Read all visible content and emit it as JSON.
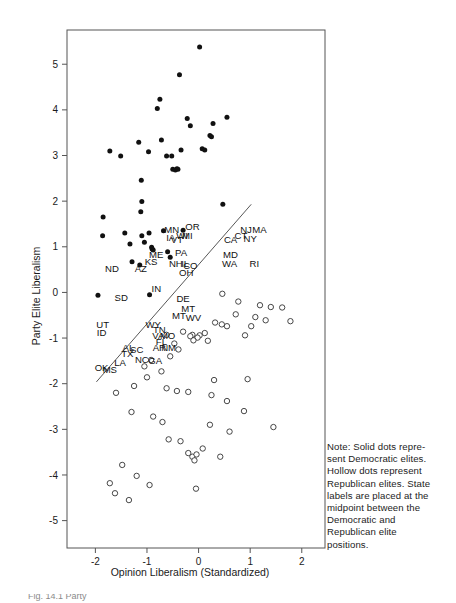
{
  "figure": {
    "note": {
      "lines": [
        "Note: Solid dots repre-",
        "sent Democratic  elites.",
        "Hollow dots represent",
        "Republican elites. State",
        "labels are placed at the",
        "midpoint between the",
        "Democratic and",
        "Republican elite",
        "positions."
      ]
    },
    "caption_fragment": "Fig. 14.1 Party",
    "colors": {
      "democratic_dot": "#111111",
      "republican_dot": "#ffffff",
      "republican_dot_stroke": "#333333",
      "frame": "#555555",
      "fit_line": "#444444",
      "text": "#1a1a1a"
    }
  },
  "chart_data": {
    "type": "scatter",
    "title": "",
    "xlabel": "Opinion Liberalism (Standardized)",
    "ylabel": "Party Elite Liberalism",
    "xlim": [
      -2.55,
      2.45
    ],
    "ylim": [
      -5.6,
      5.75
    ],
    "xticks": [
      -2,
      -1,
      0,
      1,
      2
    ],
    "xticklabels": [
      "-2",
      "-1",
      "0",
      "1",
      "2"
    ],
    "yticks": [
      -5,
      -4,
      -3,
      -2,
      -1,
      0,
      1,
      2,
      3,
      4,
      5
    ],
    "yticklabels": [
      "-5",
      "-4",
      "-3",
      "-2",
      "-1",
      "0",
      "1",
      "2",
      "3",
      "4",
      "5"
    ],
    "grid": false,
    "legend": "none",
    "series": [
      {
        "name": "Democratic elites",
        "marker": "solid-dot",
        "points": [
          [
            -1.72,
            3.1
          ],
          [
            -1.85,
            1.65
          ],
          [
            -1.86,
            1.24
          ],
          [
            -1.51,
            2.99
          ],
          [
            -1.43,
            1.3
          ],
          [
            -1.33,
            1.06
          ],
          [
            -1.29,
            0.67
          ],
          [
            -1.16,
            3.29
          ],
          [
            -1.14,
            0.6
          ],
          [
            -1.11,
            2.46
          ],
          [
            -1.1,
            1.99
          ],
          [
            -1.12,
            1.77
          ],
          [
            -1.1,
            1.24
          ],
          [
            -1.05,
            1.1
          ],
          [
            -0.97,
            3.08
          ],
          [
            -0.96,
            1.3
          ],
          [
            -0.91,
            0.99
          ],
          [
            -0.9,
            0.95
          ],
          [
            -0.88,
            0.93
          ],
          [
            -0.8,
            4.03
          ],
          [
            -0.75,
            4.23
          ],
          [
            -0.72,
            3.34
          ],
          [
            -0.62,
            2.99
          ],
          [
            -0.6,
            0.89
          ],
          [
            -0.55,
            0.77
          ],
          [
            -0.52,
            2.99
          ],
          [
            -0.5,
            2.7
          ],
          [
            -0.45,
            2.68
          ],
          [
            -0.42,
            2.71
          ],
          [
            -0.4,
            2.7
          ],
          [
            -0.37,
            4.77
          ],
          [
            -0.34,
            3.12
          ],
          [
            -0.3,
            1.36
          ],
          [
            -0.22,
            3.81
          ],
          [
            -0.16,
            3.65
          ],
          [
            0.02,
            5.38
          ],
          [
            0.07,
            3.15
          ],
          [
            0.12,
            3.12
          ],
          [
            0.22,
            3.44
          ],
          [
            0.25,
            3.41
          ],
          [
            0.28,
            3.7
          ],
          [
            0.55,
            3.84
          ],
          [
            0.47,
            1.93
          ],
          [
            -0.68,
            1.35
          ],
          [
            -1.95,
            -0.06
          ],
          [
            -0.95,
            -0.05
          ]
        ]
      },
      {
        "name": "Republican elites",
        "marker": "hollow-dot",
        "points": [
          [
            0.46,
            -0.03
          ],
          [
            0.77,
            -0.2
          ],
          [
            1.19,
            -0.28
          ],
          [
            1.4,
            -0.32
          ],
          [
            1.62,
            -0.33
          ],
          [
            0.72,
            -0.48
          ],
          [
            1.1,
            -0.54
          ],
          [
            1.3,
            -0.61
          ],
          [
            1.78,
            -0.63
          ],
          [
            0.32,
            -0.66
          ],
          [
            0.45,
            -0.7
          ],
          [
            0.55,
            -0.74
          ],
          [
            1.02,
            -0.74
          ],
          [
            -0.3,
            -0.86
          ],
          [
            0.12,
            -0.89
          ],
          [
            -0.12,
            -0.93
          ],
          [
            0.02,
            -0.94
          ],
          [
            -0.16,
            -0.96
          ],
          [
            -0.02,
            -0.99
          ],
          [
            -0.1,
            -1.05
          ],
          [
            0.18,
            -1.06
          ],
          [
            0.9,
            -0.94
          ],
          [
            -0.62,
            -0.93
          ],
          [
            -0.47,
            -1.12
          ],
          [
            -0.39,
            -1.25
          ],
          [
            -0.55,
            -1.4
          ],
          [
            -0.92,
            -1.48
          ],
          [
            -1.05,
            -1.62
          ],
          [
            -0.72,
            -1.73
          ],
          [
            -1.0,
            -1.86
          ],
          [
            -1.6,
            -2.2
          ],
          [
            -1.25,
            -2.05
          ],
          [
            -0.62,
            -2.1
          ],
          [
            -0.42,
            -2.16
          ],
          [
            -0.2,
            -2.18
          ],
          [
            0.25,
            -2.25
          ],
          [
            0.55,
            -2.38
          ],
          [
            0.88,
            -2.6
          ],
          [
            -1.3,
            -2.62
          ],
          [
            -0.88,
            -2.72
          ],
          [
            -0.7,
            -2.84
          ],
          [
            0.22,
            -2.9
          ],
          [
            0.6,
            -3.05
          ],
          [
            -0.58,
            -3.22
          ],
          [
            -0.35,
            -3.26
          ],
          [
            0.08,
            -3.42
          ],
          [
            -0.2,
            -3.52
          ],
          [
            -0.12,
            -3.6
          ],
          [
            -0.04,
            -3.55
          ],
          [
            -0.08,
            -3.68
          ],
          [
            0.42,
            -3.6
          ],
          [
            -1.48,
            -3.78
          ],
          [
            -1.2,
            -4.02
          ],
          [
            -1.72,
            -4.18
          ],
          [
            -0.95,
            -4.22
          ],
          [
            -1.62,
            -4.4
          ],
          [
            -1.35,
            -4.55
          ],
          [
            0.3,
            -1.92
          ],
          [
            0.95,
            -1.9
          ],
          [
            1.45,
            -2.95
          ],
          [
            -0.05,
            -4.3
          ]
        ]
      }
    ],
    "fit_line": {
      "x0": -1.98,
      "y0": -1.96,
      "x1": 1.02,
      "y1": 1.93
    },
    "state_labels": [
      {
        "text": "ND",
        "x": -1.68,
        "y": 0.45
      },
      {
        "text": "SD",
        "x": -1.5,
        "y": -0.18
      },
      {
        "text": "UT",
        "x": -1.86,
        "y": -0.78
      },
      {
        "text": "ID",
        "x": -1.88,
        "y": -0.95
      },
      {
        "text": "OK",
        "x": -1.88,
        "y": -1.72
      },
      {
        "text": "MS",
        "x": -1.72,
        "y": -1.77
      },
      {
        "text": "LA",
        "x": -1.52,
        "y": -1.62
      },
      {
        "text": "TX",
        "x": -1.38,
        "y": -1.42
      },
      {
        "text": "AL",
        "x": -1.36,
        "y": -1.28
      },
      {
        "text": "SC",
        "x": -1.2,
        "y": -1.33
      },
      {
        "text": "NC",
        "x": -1.1,
        "y": -1.55
      },
      {
        "text": "GA",
        "x": -0.84,
        "y": -1.56
      },
      {
        "text": "AZ",
        "x": -1.12,
        "y": 0.45
      },
      {
        "text": "KS",
        "x": -0.92,
        "y": 0.6
      },
      {
        "text": "IN",
        "x": -0.82,
        "y": 0.0
      },
      {
        "text": "WY",
        "x": -0.88,
        "y": -0.77
      },
      {
        "text": "TN",
        "x": -0.76,
        "y": -0.88
      },
      {
        "text": "VA",
        "x": -0.78,
        "y": -1.03
      },
      {
        "text": "FL",
        "x": -0.72,
        "y": -1.15
      },
      {
        "text": "AR",
        "x": -0.76,
        "y": -1.28
      },
      {
        "text": "MO",
        "x": -0.6,
        "y": -1.03
      },
      {
        "text": "NM",
        "x": -0.58,
        "y": -1.28
      },
      {
        "text": "ME",
        "x": -0.82,
        "y": 0.75
      },
      {
        "text": "MN",
        "x": -0.52,
        "y": 1.3
      },
      {
        "text": "IA",
        "x": -0.54,
        "y": 1.12
      },
      {
        "text": "VT",
        "x": -0.42,
        "y": 1.08
      },
      {
        "text": "WI",
        "x": -0.32,
        "y": 1.18
      },
      {
        "text": "MI",
        "x": -0.22,
        "y": 1.18
      },
      {
        "text": "OR",
        "x": -0.12,
        "y": 1.37
      },
      {
        "text": "PA",
        "x": -0.34,
        "y": 0.8
      },
      {
        "text": "NH",
        "x": -0.44,
        "y": 0.56
      },
      {
        "text": "IL",
        "x": -0.26,
        "y": 0.56
      },
      {
        "text": "CO",
        "x": -0.16,
        "y": 0.52
      },
      {
        "text": "OH",
        "x": -0.24,
        "y": 0.36
      },
      {
        "text": "DE",
        "x": -0.3,
        "y": -0.22
      },
      {
        "text": "MT",
        "x": -0.2,
        "y": -0.42
      },
      {
        "text": "MT",
        "x": -0.38,
        "y": -0.58
      },
      {
        "text": "WV",
        "x": -0.1,
        "y": -0.62
      },
      {
        "text": "CA",
        "x": 0.62,
        "y": 1.08
      },
      {
        "text": "CT",
        "x": 0.82,
        "y": 1.18
      },
      {
        "text": "NJ",
        "x": 0.92,
        "y": 1.3
      },
      {
        "text": "NY",
        "x": 1.0,
        "y": 1.1
      },
      {
        "text": "MA",
        "x": 1.18,
        "y": 1.3
      },
      {
        "text": "MD",
        "x": 0.62,
        "y": 0.75
      },
      {
        "text": "WA",
        "x": 0.6,
        "y": 0.55
      },
      {
        "text": "RI",
        "x": 1.08,
        "y": 0.56
      }
    ]
  }
}
